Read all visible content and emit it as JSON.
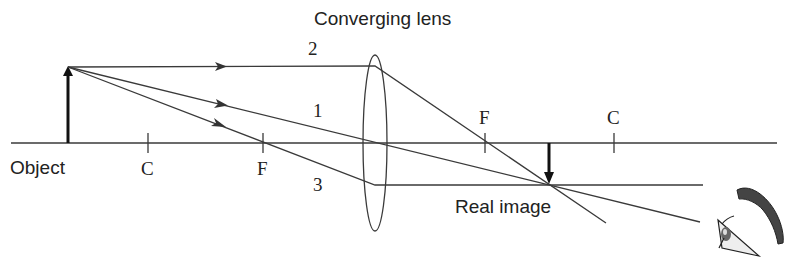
{
  "title": "Converging lens",
  "labels": {
    "object": "Object",
    "real_image": "Real image",
    "ray1": "1",
    "ray2": "2",
    "ray3": "3",
    "c_left": "C",
    "f_left": "F",
    "f_right": "F",
    "c_right": "C"
  },
  "colors": {
    "line": "#3a3a3a",
    "eyebrow": "#444444",
    "background": "#ffffff"
  }
}
